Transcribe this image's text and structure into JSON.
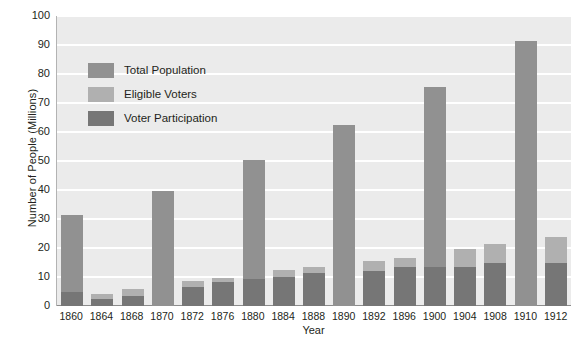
{
  "chart_data": {
    "type": "bar",
    "stacked": true,
    "title": "",
    "xlabel": "Year",
    "ylabel": "Number of People (Millions)",
    "ylim": [
      0,
      100
    ],
    "ytick_step": 10,
    "yticks": [
      100,
      90,
      80,
      70,
      60,
      50,
      40,
      30,
      20,
      10,
      0
    ],
    "grid": true,
    "legend_position": "upper-left-inside",
    "categories": [
      "1860",
      "1864",
      "1868",
      "1870",
      "1872",
      "1876",
      "1880",
      "1884",
      "1888",
      "1890",
      "1892",
      "1896",
      "1900",
      "1904",
      "1908",
      "1910",
      "1912"
    ],
    "series": [
      {
        "name": "Total Population",
        "color": "#919191",
        "values": [
          31.5,
          4.0,
          5.8,
          39.5,
          8.5,
          9.5,
          50.2,
          12.5,
          13.5,
          62.5,
          15.5,
          16.5,
          75.5,
          19.8,
          21.5,
          91.5,
          23.8
        ]
      },
      {
        "name": "Eligible Voters",
        "color": "#b0b0b0",
        "values": [
          0,
          4.0,
          5.8,
          0,
          8.5,
          9.5,
          0,
          12.5,
          13.5,
          0,
          15.5,
          16.5,
          0,
          19.8,
          21.5,
          0,
          23.8
        ]
      },
      {
        "name": "Voter Participation",
        "color": "#767676",
        "values": [
          4.8,
          2.5,
          3.3,
          0,
          6.5,
          8.3,
          9.2,
          10.0,
          11.4,
          0,
          12.0,
          13.5,
          13.5,
          13.5,
          14.9,
          0,
          15.0
        ]
      }
    ]
  },
  "legend": {
    "items": [
      {
        "label": "Total Population",
        "color": "#919191"
      },
      {
        "label": "Eligible Voters",
        "color": "#b0b0b0"
      },
      {
        "label": "Voter Participation",
        "color": "#767676"
      }
    ]
  },
  "axes": {
    "y_title": "Number of People (Millions)",
    "x_title": "Year"
  }
}
